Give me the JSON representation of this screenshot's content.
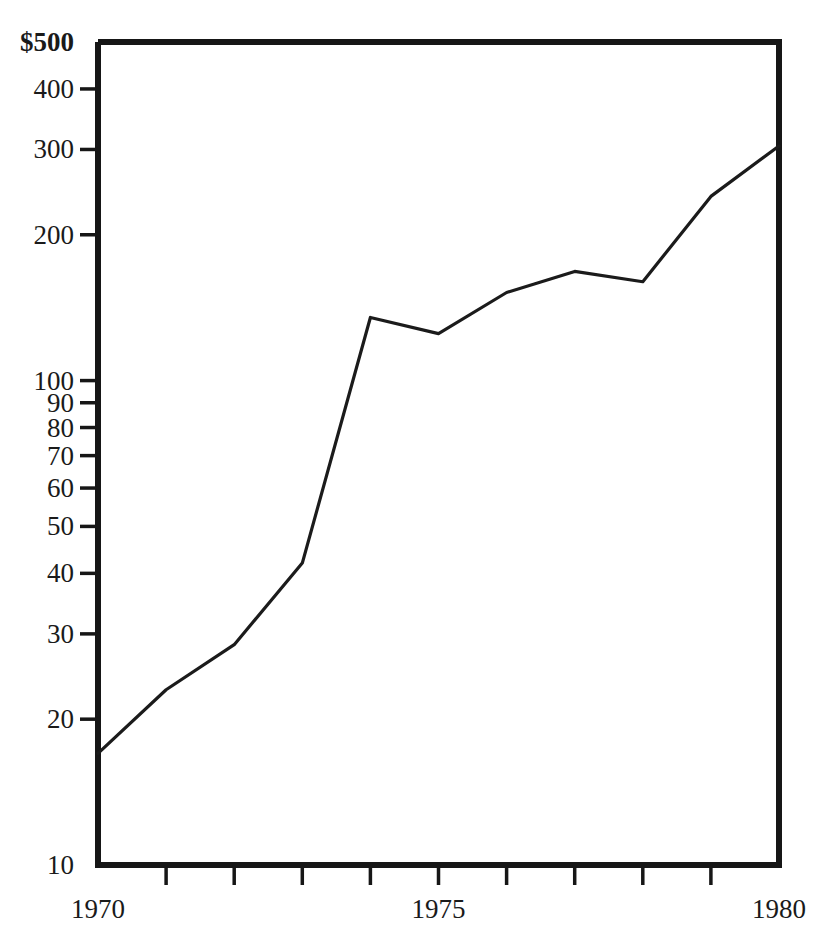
{
  "chart_data": {
    "type": "line",
    "title": "",
    "subtitle": "",
    "xlabel": "",
    "ylabel": "",
    "yscale": "log",
    "ylim": [
      10,
      500
    ],
    "xlim": [
      1970,
      1980
    ],
    "grid": false,
    "legend": null,
    "y_ticks": [
      {
        "value": 500,
        "label": "$500",
        "bold": true
      },
      {
        "value": 400,
        "label": "400",
        "bold": false
      },
      {
        "value": 300,
        "label": "300",
        "bold": false
      },
      {
        "value": 200,
        "label": "200",
        "bold": false
      },
      {
        "value": 100,
        "label": "100",
        "bold": false
      },
      {
        "value": 90,
        "label": "90",
        "bold": false
      },
      {
        "value": 80,
        "label": "80",
        "bold": false
      },
      {
        "value": 70,
        "label": "70",
        "bold": false
      },
      {
        "value": 60,
        "label": "60",
        "bold": false
      },
      {
        "value": 50,
        "label": "50",
        "bold": false
      },
      {
        "value": 40,
        "label": "40",
        "bold": false
      },
      {
        "value": 30,
        "label": "30",
        "bold": false
      },
      {
        "value": 20,
        "label": "20",
        "bold": false
      },
      {
        "value": 10,
        "label": "10",
        "bold": false
      }
    ],
    "x_ticks": [
      1970,
      1971,
      1972,
      1973,
      1974,
      1975,
      1976,
      1977,
      1978,
      1979,
      1980
    ],
    "x_tick_labels": [
      {
        "value": 1970,
        "label": "1970"
      },
      {
        "value": 1975,
        "label": "1975"
      },
      {
        "value": 1980,
        "label": "1980"
      }
    ],
    "x": [
      1970,
      1971,
      1972,
      1973,
      1974,
      1975,
      1976,
      1977,
      1978,
      1979,
      1980
    ],
    "values": [
      17,
      23,
      28.5,
      42,
      135,
      125,
      152,
      168,
      160,
      240,
      305
    ],
    "series": [
      {
        "name": "",
        "x": [
          1970,
          1971,
          1972,
          1973,
          1974,
          1975,
          1976,
          1977,
          1978,
          1979,
          1980
        ],
        "values": [
          17,
          23,
          28.5,
          42,
          135,
          125,
          152,
          168,
          160,
          240,
          305
        ]
      }
    ],
    "line_color": "#1b1b1b",
    "frame_color": "#161616",
    "background_color": "#ffffff"
  },
  "axes": {
    "y_axis_name": "y-axis",
    "x_axis_name": "x-axis",
    "plot_area_name": "plot-area"
  }
}
